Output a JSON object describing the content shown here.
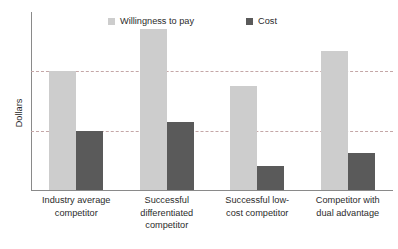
{
  "chart_data": {
    "type": "bar",
    "title": "",
    "xlabel": "",
    "ylabel": "Dollars",
    "categories": [
      "Industry average competitor",
      "Successful differentiated competitor",
      "Successful low-cost competitor",
      "Competitor with dual advantage"
    ],
    "series": [
      {
        "name": "Willingness to pay",
        "color": "#cdcdcd",
        "values": [
          100,
          136,
          88,
          117
        ]
      },
      {
        "name": "Cost",
        "color": "#5a5a5a",
        "values": [
          50,
          57,
          20,
          31
        ]
      }
    ],
    "ylim": [
      0,
      150
    ],
    "y_tick_labels": [],
    "gridlines": {
      "visible": true,
      "style": "dashed",
      "color": "#c4a7a7",
      "values": [
        50,
        100
      ]
    },
    "legend": {
      "position": "top",
      "entries": [
        "Willingness to pay",
        "Cost"
      ]
    },
    "axis_color": "#8a8a8a"
  },
  "legend": {
    "entries": [
      {
        "label": "Willingness to pay",
        "color": "#cdcdcd"
      },
      {
        "label": "Cost",
        "color": "#5a5a5a"
      }
    ]
  },
  "axes": {
    "y_title": "Dollars"
  },
  "categories": [
    {
      "line1": "Industry average",
      "line2": "competitor",
      "line3": ""
    },
    {
      "line1": "Successful",
      "line2": "differentiated",
      "line3": "competitor"
    },
    {
      "line1": "Successful low-",
      "line2": "cost competitor",
      "line3": ""
    },
    {
      "line1": "Competitor with",
      "line2": "dual advantage",
      "line3": ""
    }
  ]
}
